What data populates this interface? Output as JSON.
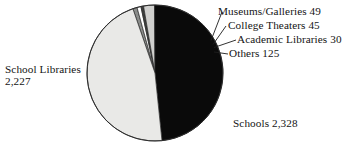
{
  "chart_data": {
    "type": "pie",
    "title": "",
    "subtitle": "",
    "xlabel": "",
    "ylabel": "",
    "legend_position": "callout-labels",
    "grid": false,
    "total": 4804,
    "categories": [
      "Schools",
      "School Libraries",
      "Others",
      "Museums/Galleries",
      "College Theaters",
      "Academic Libraries"
    ],
    "values": [
      2328,
      2227,
      125,
      49,
      45,
      30
    ],
    "slices": [
      {
        "name": "Schools",
        "value": 2328,
        "value_text": "2,328",
        "label": "Schools 2,328",
        "color": "#0a0a0a"
      },
      {
        "name": "School Libraries",
        "value": 2227,
        "value_text": "2,227",
        "label": "School Libraries 2,227",
        "color": "#e9e9e7"
      },
      {
        "name": "Others",
        "value": 125,
        "value_text": "125",
        "label": "Others 125",
        "color": "#d0d0ce"
      },
      {
        "name": "Museums/Galleries",
        "value": 49,
        "value_text": "49",
        "label": "Museums/Galleries 49",
        "color": "#8a8c8a"
      },
      {
        "name": "College Theaters",
        "value": 45,
        "value_text": "45",
        "label": "College Theaters 45",
        "color": "#ffffff"
      },
      {
        "name": "Academic Libraries",
        "value": 30,
        "value_text": "30",
        "label": "Academic Libraries 30",
        "color": "#3c3e3c"
      }
    ]
  },
  "labels": {
    "school_libraries_name": "School Libraries",
    "school_libraries_value": "2,227",
    "schools": "Schools 2,328",
    "museums": "Museums/Galleries 49",
    "college_theaters": "College Theaters 45",
    "academic_libraries": "Academic Libraries 30",
    "others": "Others 125"
  },
  "colors": {
    "background": "#ffffff",
    "outline": "#2b2b2b",
    "text": "#141414",
    "leader_line": "#1d1d1d"
  },
  "bleed_through": {
    "note": "faint show-through text from reverse of scanned page",
    "lines": [
      "can be as",
      "m. For exam",
      "ssumed",
      "ection flow",
      "ould the",
      "librarian",
      "ance you"
    ]
  }
}
